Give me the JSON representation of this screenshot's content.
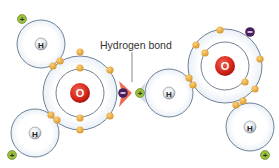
{
  "diagram": {
    "label": "Hydrogen bond",
    "atoms": {
      "oxygen_symbol": "O",
      "hydrogen_symbol": "H"
    },
    "charges": {
      "positive": "+",
      "negative": "−"
    },
    "colors": {
      "shell_stroke": "#6f8296",
      "shell_fill": "#f4f8fb",
      "electron": "#e8a93a",
      "electron_stroke": "#c98a22",
      "oxygen_nucleus": "#d6261b",
      "hydrogen_nucleus": "#dfe3e8",
      "positive_charge": "#9bbf3a",
      "negative_charge": "#4a1e5e",
      "bond_arrow_negative": "#e8553a",
      "bond_arrow_positive": "#c9d6e6"
    },
    "molecules": [
      {
        "name": "left-water-molecule",
        "oxygen": {
          "cx": 80,
          "cy": 93
        },
        "hydrogens": [
          {
            "cx": 41,
            "cy": 44
          },
          {
            "cx": 35,
            "cy": 133
          }
        ]
      },
      {
        "name": "right-water-molecule",
        "oxygen": {
          "cx": 225,
          "cy": 66
        },
        "hydrogens": [
          {
            "cx": 169,
            "cy": 93
          },
          {
            "cx": 250,
            "cy": 127
          }
        ]
      }
    ]
  }
}
